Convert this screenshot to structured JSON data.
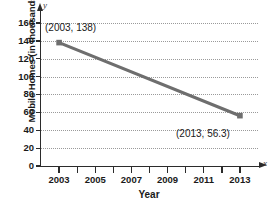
{
  "chart_data": {
    "type": "line",
    "title": "",
    "xlabel": "Year",
    "ylabel": "Mobile Homes (in thousands)",
    "x": [
      2003,
      2013
    ],
    "values": [
      138,
      56.3
    ],
    "series": [
      {
        "name": "Mobile Homes",
        "x": [
          2003,
          2013
        ],
        "values": [
          138,
          56.3
        ]
      }
    ],
    "xlim": [
      2002,
      2014
    ],
    "ylim": [
      0,
      170
    ],
    "grid": true,
    "legend": null,
    "line_color": "#6e6e6e",
    "marker_color": "#6e6e6e",
    "axis_color": "#2b2b2b",
    "grid_color": "#9a9a9a",
    "xticks": [
      2003,
      2004,
      2005,
      2006,
      2007,
      2008,
      2009,
      2010,
      2011,
      2012,
      2013
    ],
    "xtick_labels": [
      "2003",
      "",
      "2005",
      "",
      "2007",
      "",
      "2009",
      "",
      "2011",
      "",
      "2013"
    ],
    "yticks": [
      0,
      20,
      40,
      60,
      80,
      100,
      120,
      140,
      160
    ],
    "ytick_labels": [
      "0",
      "20",
      "40",
      "60",
      "80",
      "100",
      "120",
      "140",
      "160"
    ],
    "annotations": [
      {
        "label": "(2003, 138)",
        "x": 2003,
        "y": 138
      },
      {
        "label": "(2013, 56.3)",
        "x": 2013,
        "y": 56.3
      }
    ],
    "axis_letters": {
      "x": "x",
      "y": "y"
    }
  }
}
